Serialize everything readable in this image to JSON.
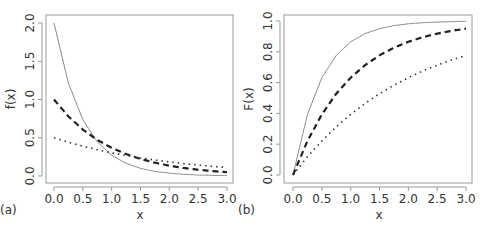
{
  "chart_data": [
    {
      "type": "line",
      "panel_label": "(a)",
      "title": "",
      "xlabel": "x",
      "ylabel": "f(x)",
      "xlim": [
        0,
        3
      ],
      "ylim": [
        0,
        2
      ],
      "xticks": [
        "0.0",
        "0.5",
        "1.0",
        "1.5",
        "2.0",
        "2.5",
        "3.0"
      ],
      "yticks": [
        "0.0",
        "0.5",
        "1.0",
        "1.5",
        "2.0"
      ],
      "grid": false,
      "legend": null,
      "x": [
        0,
        0.25,
        0.5,
        0.75,
        1.0,
        1.25,
        1.5,
        1.75,
        2.0,
        2.25,
        2.5,
        2.75,
        3.0
      ],
      "series": [
        {
          "name": "solid",
          "style": "solid",
          "values": [
            2.0,
            1.213,
            0.736,
            0.446,
            0.271,
            0.164,
            0.1,
            0.06,
            0.037,
            0.022,
            0.013,
            0.008,
            0.005
          ]
        },
        {
          "name": "dashed",
          "style": "dashed",
          "values": [
            1.0,
            0.779,
            0.607,
            0.472,
            0.368,
            0.287,
            0.223,
            0.174,
            0.135,
            0.105,
            0.082,
            0.064,
            0.05
          ]
        },
        {
          "name": "dotted",
          "style": "dotted",
          "values": [
            0.5,
            0.441,
            0.389,
            0.344,
            0.303,
            0.268,
            0.236,
            0.208,
            0.184,
            0.162,
            0.143,
            0.126,
            0.112
          ]
        }
      ]
    },
    {
      "type": "line",
      "panel_label": "(b)",
      "title": "",
      "xlabel": "x",
      "ylabel": "F(x)",
      "xlim": [
        0,
        3
      ],
      "ylim": [
        0,
        1
      ],
      "xticks": [
        "0.0",
        "0.5",
        "1.0",
        "1.5",
        "2.0",
        "2.5",
        "3.0"
      ],
      "yticks": [
        "0.0",
        "0.2",
        "0.4",
        "0.6",
        "0.8",
        "1.0"
      ],
      "grid": false,
      "legend": null,
      "x": [
        0,
        0.25,
        0.5,
        0.75,
        1.0,
        1.25,
        1.5,
        1.75,
        2.0,
        2.25,
        2.5,
        2.75,
        3.0
      ],
      "series": [
        {
          "name": "solid",
          "style": "solid",
          "values": [
            0.0,
            0.393,
            0.632,
            0.777,
            0.865,
            0.918,
            0.95,
            0.97,
            0.982,
            0.989,
            0.993,
            0.996,
            0.998
          ]
        },
        {
          "name": "dashed",
          "style": "dashed",
          "values": [
            0.0,
            0.221,
            0.393,
            0.528,
            0.632,
            0.713,
            0.777,
            0.826,
            0.865,
            0.895,
            0.918,
            0.936,
            0.95
          ]
        },
        {
          "name": "dotted",
          "style": "dotted",
          "values": [
            0.0,
            0.118,
            0.221,
            0.313,
            0.393,
            0.465,
            0.528,
            0.583,
            0.632,
            0.675,
            0.713,
            0.747,
            0.777
          ]
        }
      ]
    }
  ],
  "panels": [
    {
      "label": "(a)",
      "xlabel": "x",
      "ylabel": "f(x)"
    },
    {
      "label": "(b)",
      "xlabel": "x",
      "ylabel": "F(x)"
    }
  ]
}
